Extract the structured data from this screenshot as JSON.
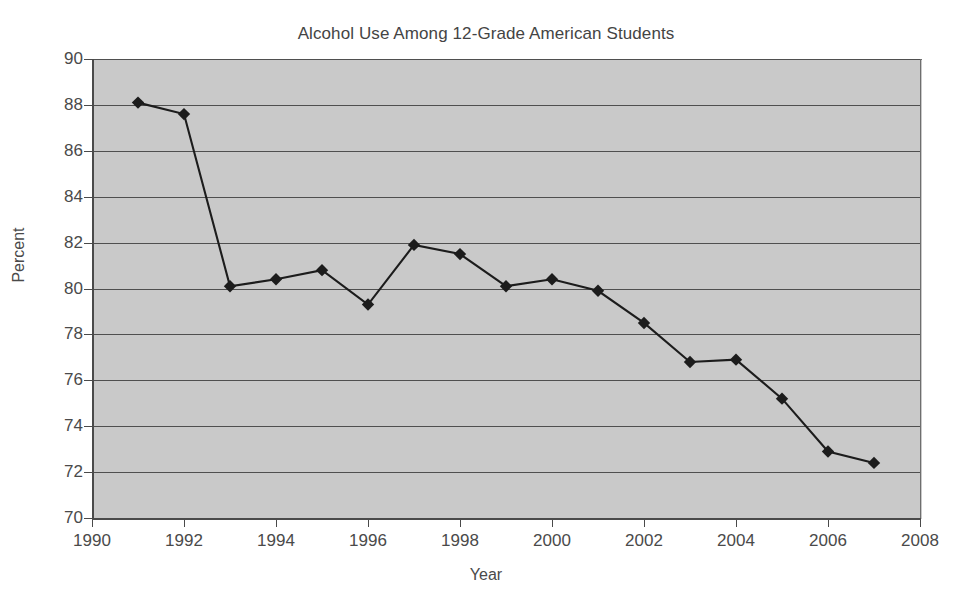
{
  "chart_data": {
    "type": "line",
    "title": "Alcohol Use Among 12-Grade American Students",
    "xlabel": "Year",
    "ylabel": "Percent",
    "xlim": [
      1990,
      2008
    ],
    "ylim": [
      70,
      90
    ],
    "xticks": [
      1990,
      1992,
      1994,
      1996,
      1998,
      2000,
      2002,
      2004,
      2006,
      2008
    ],
    "yticks": [
      70,
      72,
      74,
      76,
      78,
      80,
      82,
      84,
      86,
      88,
      90
    ],
    "grid": "horizontal",
    "legend": "none",
    "marker": "diamond",
    "series": [
      {
        "name": "Alcohol Use",
        "x": [
          1991,
          1992,
          1993,
          1994,
          1995,
          1996,
          1997,
          1998,
          1999,
          2000,
          2001,
          2002,
          2003,
          2004,
          2005,
          2006,
          2007
        ],
        "values": [
          88.1,
          87.6,
          80.1,
          80.4,
          80.8,
          79.3,
          81.9,
          81.5,
          80.1,
          80.4,
          79.9,
          78.5,
          76.8,
          76.9,
          75.2,
          72.9,
          72.4
        ]
      }
    ]
  },
  "style": {
    "plot_background": "#c9c9c9",
    "page_background": "#ffffff",
    "line_color": "#1c1c1c",
    "grid_color": "#4f4f4f",
    "axis_color": "#4a4a4a",
    "text_color": "#4a4a4a"
  }
}
